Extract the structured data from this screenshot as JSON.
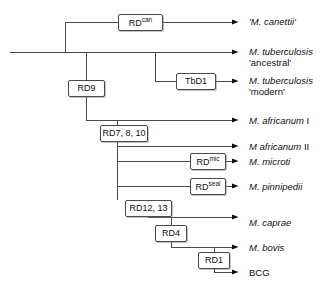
{
  "diagram": {
    "type": "cladogram",
    "line_color": "#4a4a4a",
    "text_color": "#111111",
    "background": "#ffffff"
  },
  "nodes": [
    {
      "id": "rd_can",
      "name": "RD",
      "sup": "can",
      "label": "RDcan",
      "x": 118,
      "y": 14,
      "w": 45,
      "h": 17
    },
    {
      "id": "rd9",
      "name": "RD9",
      "sup": "",
      "label": "RD9",
      "x": 68,
      "y": 80,
      "w": 37,
      "h": 17
    },
    {
      "id": "tbd1",
      "name": "TbD1",
      "sup": "",
      "label": "TbD1",
      "x": 176,
      "y": 73,
      "w": 40,
      "h": 17
    },
    {
      "id": "rd7_8_10",
      "name": "RD7, 8, 10",
      "sup": "",
      "label": "RD7, 8, 10",
      "x": 100,
      "y": 125,
      "w": 48,
      "h": 17
    },
    {
      "id": "rd_mic",
      "name": "RD",
      "sup": "mic",
      "label": "RDmic",
      "x": 190,
      "y": 153,
      "w": 36,
      "h": 17
    },
    {
      "id": "rd_seal",
      "name": "RD",
      "sup": "seal",
      "label": "RDseal",
      "x": 190,
      "y": 178,
      "w": 36,
      "h": 17
    },
    {
      "id": "rd12_13",
      "name": "RD12, 13",
      "sup": "",
      "label": "RD12, 13",
      "x": 125,
      "y": 200,
      "w": 47,
      "h": 17
    },
    {
      "id": "rd4",
      "name": "RD4",
      "sup": "",
      "label": "RD4",
      "x": 155,
      "y": 225,
      "w": 32,
      "h": 17
    },
    {
      "id": "rd1",
      "name": "RD1",
      "sup": "",
      "label": "RD1",
      "x": 198,
      "y": 252,
      "w": 32,
      "h": 17
    }
  ],
  "leaves": [
    {
      "id": "canettii",
      "line1_italic": "'M. canettii'",
      "line1_upright": "",
      "line2": "",
      "x": 249,
      "y": 16,
      "arrow_y": 22,
      "arrow_x": 232
    },
    {
      "id": "tb_ancestral",
      "line1_italic": "M. tuberculosis",
      "line1_upright": "",
      "line2": "'ancestral'",
      "x": 249,
      "y": 46,
      "arrow_y": 52,
      "arrow_x": 232
    },
    {
      "id": "tb_modern",
      "line1_italic": "M. tuberculosis",
      "line1_upright": "",
      "line2": "'modern'",
      "x": 249,
      "y": 75,
      "arrow_y": 81,
      "arrow_x": 232
    },
    {
      "id": "afr_i",
      "line1_italic": "M. africanum",
      "line1_upright": " I",
      "line2": "",
      "x": 249,
      "y": 115,
      "arrow_y": 120,
      "arrow_x": 232
    },
    {
      "id": "afr_ii",
      "line1_italic": "M africanum",
      "line1_upright": " II",
      "line2": "",
      "x": 249,
      "y": 141,
      "arrow_y": 146,
      "arrow_x": 232
    },
    {
      "id": "microti",
      "line1_italic": "M. microti",
      "line1_upright": "",
      "line2": "",
      "x": 249,
      "y": 156,
      "arrow_y": 161,
      "arrow_x": 232
    },
    {
      "id": "pinnipedii",
      "line1_italic": "M. pinnipedii",
      "line1_upright": "",
      "line2": "",
      "x": 249,
      "y": 181,
      "arrow_y": 186,
      "arrow_x": 232
    },
    {
      "id": "caprae",
      "line1_italic": "M. caprae",
      "line1_upright": "",
      "line2": "",
      "x": 249,
      "y": 217,
      "arrow_y": 222,
      "arrow_x": 232
    },
    {
      "id": "bovis",
      "line1_italic": "M. bovis",
      "line1_upright": "",
      "line2": "",
      "x": 249,
      "y": 242,
      "arrow_y": 247,
      "arrow_x": 232
    },
    {
      "id": "bcg",
      "line1_italic": "",
      "line1_upright": "BCG",
      "line2": "",
      "x": 249,
      "y": 267,
      "arrow_y": 272,
      "arrow_x": 232
    }
  ]
}
